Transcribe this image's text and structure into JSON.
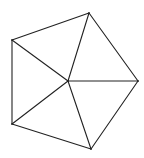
{
  "diagram": {
    "title": "",
    "colors": {
      "stroke": "#222222",
      "background": "#ffffff"
    },
    "vertices": [
      {
        "id": "A",
        "label": ""
      },
      {
        "id": "B",
        "label": ""
      },
      {
        "id": "C",
        "label": ""
      },
      {
        "id": "D",
        "label": ""
      },
      {
        "id": "E",
        "label": ""
      },
      {
        "id": "O",
        "label": ""
      }
    ],
    "edges": [
      [
        "A",
        "B"
      ],
      [
        "B",
        "C"
      ],
      [
        "C",
        "D"
      ],
      [
        "D",
        "E"
      ],
      [
        "E",
        "A"
      ],
      [
        "O",
        "A"
      ],
      [
        "O",
        "B"
      ],
      [
        "O",
        "C"
      ],
      [
        "O",
        "D"
      ],
      [
        "O",
        "E"
      ]
    ]
  }
}
